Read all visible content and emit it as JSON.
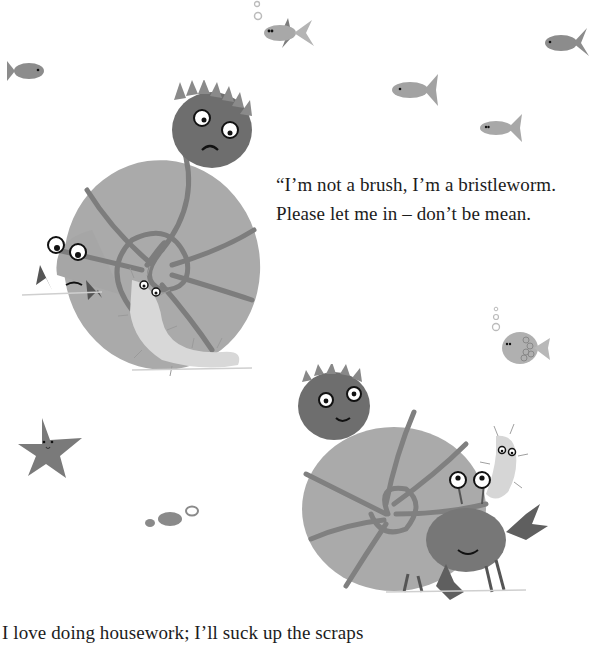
{
  "page": {
    "background": "#ffffff",
    "verse_top": {
      "lines": [
        "“I’m not a brush, I’m a bristleworm.",
        "Please let me in – don’t be mean."
      ]
    },
    "verse_bottom": {
      "lines": [
        "I love doing housework; I’ll suck up the scraps"
      ]
    }
  },
  "illustrations": {
    "fish": [
      {
        "name": "fish-top-center",
        "x": 262,
        "y": 14
      },
      {
        "name": "fish-top-right",
        "x": 545,
        "y": 26
      },
      {
        "name": "fish-left",
        "x": 6,
        "y": 58
      },
      {
        "name": "fish-mid-right",
        "x": 392,
        "y": 72
      },
      {
        "name": "fish-right-lower",
        "x": 480,
        "y": 112
      },
      {
        "name": "pufferfish",
        "x": 500,
        "y": 327
      }
    ],
    "colors": {
      "shell": "#a9a9a9",
      "shell_lines": "#7d7d7d",
      "anemone": "#707070",
      "fish": "#8c8c8c",
      "worm": "#d6d6d6",
      "crab": "#777777",
      "star": "#7a7a7a"
    }
  }
}
